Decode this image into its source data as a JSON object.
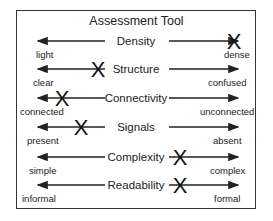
{
  "title": "Assessment Tool",
  "rows": [
    {
      "label": "Density",
      "left": "light",
      "right": "dense",
      "mark_x": 234
    },
    {
      "label": "Structure",
      "left": "clear",
      "right": "confused",
      "mark_x": 98
    },
    {
      "label": "Connectivity",
      "left": "connected",
      "right": "unconnected",
      "mark_x": 62
    },
    {
      "label": "Signals",
      "left": "present",
      "right": "absent",
      "mark_x": 81
    },
    {
      "label": "Complexity",
      "left": "simple",
      "right": "complex",
      "mark_x": 180
    },
    {
      "label": "Readability",
      "left": "informal",
      "right": "formal",
      "mark_x": 180
    }
  ],
  "mark_symbol": "X",
  "colors": {
    "line": "#222222",
    "border": "#333333",
    "background": "#ffffff"
  }
}
